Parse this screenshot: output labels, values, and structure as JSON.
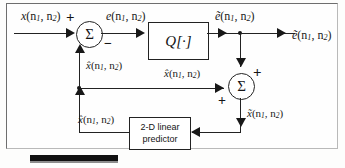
{
  "figure": {
    "blocks": {
      "quantizer": "Q[·]",
      "predictor_line1": "2-D linear",
      "predictor_line2": "predictor",
      "summer_glyph": "Σ"
    },
    "signals": {
      "input": {
        "base": "x",
        "arg": "(n",
        "sub1": "1",
        "mid": ", n",
        "sub2": "2",
        "close": ")"
      },
      "error": {
        "base": "e",
        "arg": "(n",
        "sub1": "1",
        "mid": ", n",
        "sub2": "2",
        "close": ")"
      },
      "quantized_error": {
        "base": "ẽ",
        "arg": "(n",
        "sub1": "1",
        "mid": ", n",
        "sub2": "2",
        "close": ")"
      },
      "quantized_error_out": {
        "base": "ẽ",
        "arg": "(n",
        "sub1": "1",
        "mid": ", n",
        "sub2": "2",
        "close": ")"
      },
      "prediction_feedback": {
        "base": "x̂",
        "arg": "(n",
        "sub1": "1",
        "mid": ", n",
        "sub2": "2",
        "close": ")"
      },
      "prediction_mid": {
        "base": "x̂",
        "arg": "(n",
        "sub1": "1",
        "mid": ", n",
        "sub2": "2",
        "close": ")"
      },
      "prediction_out": {
        "base": "x̂",
        "arg": "(n",
        "sub1": "1",
        "mid": ", n",
        "sub2": "2",
        "close": ")"
      },
      "reconstructed": {
        "base": "x̃",
        "arg": "(n",
        "sub1": "1",
        "mid": ", n",
        "sub2": "2",
        "close": ")"
      }
    },
    "signs": {
      "sum1_plus": "+",
      "sum1_minus": "−",
      "sum2_plus_top": "+",
      "sum2_plus_left": "+"
    },
    "colors": {
      "ink": "#181818",
      "frame": "#6e6e6e",
      "paper": "#fefefe"
    }
  }
}
